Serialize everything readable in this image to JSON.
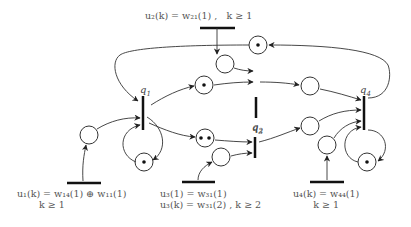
{
  "diagram": {
    "type": "timed event graph (Petri net)",
    "transitions": [
      {
        "id": "q1",
        "label": "q1"
      },
      {
        "id": "q2",
        "label": "q2"
      },
      {
        "id": "q3",
        "label": "q3"
      },
      {
        "id": "q4",
        "label": "q4"
      }
    ],
    "places": [
      {
        "id": "p_u1",
        "tokens": 0,
        "from": "u1",
        "to": "q1"
      },
      {
        "id": "p_q1_self",
        "tokens": 1,
        "from": "q1",
        "to": "q1"
      },
      {
        "id": "p_q1_q2",
        "tokens": 1,
        "from": "q1",
        "to": "q2"
      },
      {
        "id": "p_q1_q3",
        "tokens": 2,
        "from": "q1",
        "to": "q3"
      },
      {
        "id": "p_u2",
        "tokens": 0,
        "from": "u2",
        "to": "q2"
      },
      {
        "id": "p_u3",
        "tokens": 0,
        "from": "u3",
        "to": "q3"
      },
      {
        "id": "p_q2_q4",
        "tokens": 0,
        "from": "q2",
        "to": "q4"
      },
      {
        "id": "p_q3_q4",
        "tokens": 0,
        "from": "q3",
        "to": "q4"
      },
      {
        "id": "p_u4",
        "tokens": 0,
        "from": "u4",
        "to": "q4"
      },
      {
        "id": "p_q4_self",
        "tokens": 1,
        "from": "q4",
        "to": "q4"
      },
      {
        "id": "p_q4_q1",
        "tokens": 1,
        "from": "q4",
        "to": "q1"
      }
    ],
    "inputs": {
      "u1": {
        "line1": "u₁(k) = w₁₄(1) ⊕ w₁₁(1)",
        "line2": "k ≥ 1"
      },
      "u2": {
        "line1": "u₂(k) = w₂₁(1) ,",
        "line2": "k ≥ 1"
      },
      "u3": {
        "line1": "u₃(1) = w₃₁(1)",
        "line2": "u₃(k) = w₃₁(2) ,  k ≥ 2"
      },
      "u4": {
        "line1": "u₄(k) = w₄₄(1)",
        "line2": "k ≥ 1"
      }
    },
    "labels": {
      "q1": "q",
      "q1_sub": "1",
      "q2": "q",
      "q2_sub": "2",
      "q3": "q",
      "q3_sub": "3",
      "q4": "q",
      "q4_sub": "4"
    }
  }
}
